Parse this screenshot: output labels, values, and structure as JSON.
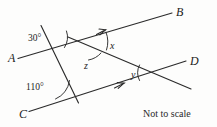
{
  "figure": {
    "type": "geometry-diagram",
    "caption": "Not to scale",
    "stroke_color": "#2b2b2b",
    "background_color": "#fdfdfc",
    "point_labels": [
      {
        "id": "A",
        "text": "A",
        "x": 8,
        "y": 52
      },
      {
        "id": "B",
        "text": "B",
        "x": 176,
        "y": 6
      },
      {
        "id": "C",
        "text": "C",
        "x": 19,
        "y": 108
      },
      {
        "id": "D",
        "text": "D",
        "x": 190,
        "y": 55
      }
    ],
    "angle_labels": [
      {
        "id": "angle-30",
        "text": "30°",
        "x": 28,
        "y": 34
      },
      {
        "id": "angle-110",
        "text": "110°",
        "x": 28,
        "y": 83
      }
    ],
    "variable_labels": [
      {
        "id": "angle-x",
        "text": "x",
        "x": 110,
        "y": 41
      },
      {
        "id": "angle-z",
        "text": "z",
        "x": 84,
        "y": 61
      },
      {
        "id": "angle-y",
        "text": "y",
        "x": 131,
        "y": 70
      }
    ],
    "vertices": {
      "P": {
        "x": 82,
        "y": 42
      },
      "Q": {
        "x": 161,
        "y": 75
      },
      "V": {
        "x": 78,
        "y": 103
      }
    },
    "lines": [
      {
        "id": "line-AB",
        "from": "A-end",
        "to": "B-end",
        "x1": 18,
        "y1": 58,
        "x2": 172,
        "y2": 13
      },
      {
        "id": "line-transversal-upper",
        "x1": 41,
        "y1": 25,
        "x2": 78,
        "y2": 103
      },
      {
        "id": "line-PQ-extended",
        "x1": 69,
        "y1": 38,
        "x2": 190,
        "y2": 88
      },
      {
        "id": "line-CD",
        "x1": 29,
        "y1": 111,
        "x2": 186,
        "y2": 61
      }
    ],
    "parallel_arrows": [
      {
        "id": "arrow-on-AB",
        "x": 103,
        "y": 31
      },
      {
        "id": "arrow-on-CD",
        "x": 122,
        "y": 85
      }
    ]
  }
}
